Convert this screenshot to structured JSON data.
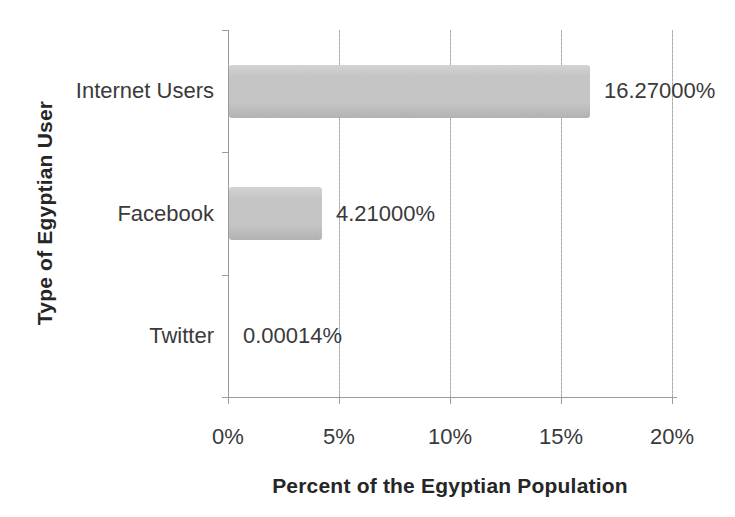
{
  "figure": {
    "background": "#ffffff"
  },
  "chart_data": {
    "type": "bar",
    "orientation": "horizontal",
    "title": "",
    "categories": [
      "Internet Users",
      "Facebook",
      "Twitter"
    ],
    "values": [
      16.27,
      4.21,
      0.00014
    ],
    "value_labels": [
      "16.27000%",
      "4.21000%",
      "0.00014%"
    ],
    "xlabel": "Percent of the Egyptian Population",
    "ylabel": "Type of Egyptian User",
    "x_tick_labels": [
      "0%",
      "5%",
      "10%",
      "15%",
      "20%"
    ],
    "x_tick_values": [
      0,
      5,
      10,
      15,
      20
    ],
    "xlim": [
      0,
      20
    ],
    "grid": "vertical",
    "legend": "none",
    "colors": {
      "bar_fill": "#c6c6c6",
      "bar_fill_light": "#d5d5d5",
      "bar_fill_dark": "#b2b2b2",
      "gridline": "#adadad",
      "axis_line": "#9b9b9b",
      "label_text": "#3a3a3a",
      "title_text": "#262626"
    }
  }
}
